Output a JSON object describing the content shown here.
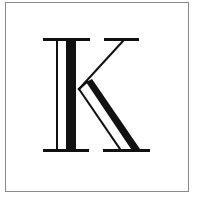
{
  "glyph": {
    "letter": "K",
    "style": "inline-outline serif capital",
    "colors": {
      "ink": "#111111",
      "background": "#ffffff",
      "frame": "#8a8a8a"
    }
  }
}
